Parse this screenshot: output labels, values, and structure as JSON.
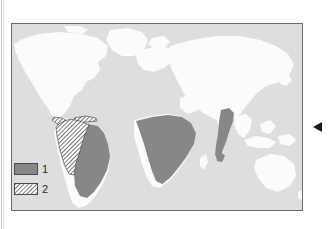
{
  "figure": {
    "background_color": "#ffffff",
    "panel": {
      "border_color": "#6b6b6b",
      "ocean_color": "#dedede",
      "land_color": "#fbfbfb",
      "land_outline_color": "#f2f2f2"
    }
  },
  "map": {
    "projection": "world",
    "ocean_label": "ocean",
    "land_label": "land",
    "regions": [
      {
        "name": "central-america-caribbean",
        "category": 2,
        "fill": "hatch"
      },
      {
        "name": "northern-south-america",
        "category": 2,
        "fill": "hatch"
      },
      {
        "name": "eastern-south-america",
        "category": 1,
        "fill": "solid"
      },
      {
        "name": "sub-saharan-africa",
        "category": 1,
        "fill": "solid"
      },
      {
        "name": "south-southeast-asia",
        "category": 1,
        "fill": "solid"
      }
    ]
  },
  "legend": {
    "items": [
      {
        "label": "1",
        "swatch": "solid",
        "color": "#878787",
        "name": "legend-swatch-category-1"
      },
      {
        "label": "2",
        "swatch": "hatch",
        "color": "#ffffff",
        "name": "legend-swatch-category-2"
      }
    ]
  },
  "annotation": {
    "pointer": {
      "name": "pointer-arrow",
      "direction": "left",
      "color": "#1a1a1a"
    }
  },
  "colors": {
    "category_1_fill": "#878787",
    "category_2_hatch_line": "#3a3a3a",
    "category_2_hatch_bg": "#ffffff",
    "ocean": "#dedede",
    "land": "#fbfbfb",
    "panel_border": "#6b6b6b",
    "text": "#2b2b2b"
  }
}
